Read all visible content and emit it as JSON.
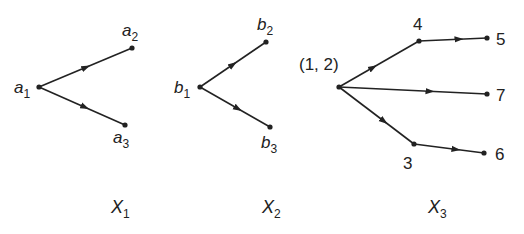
{
  "diagram": {
    "type": "directed-graphs",
    "colors": {
      "stroke": "#222222",
      "background": "#ffffff"
    },
    "graphs": [
      {
        "name": "X",
        "subscript": "1",
        "nodes": [
          {
            "id": "a1",
            "text": "a",
            "sub": "1",
            "x": 39,
            "y": 87
          },
          {
            "id": "a2",
            "text": "a",
            "sub": "2",
            "x": 132,
            "y": 48
          },
          {
            "id": "a3",
            "text": "a",
            "sub": "3",
            "x": 125,
            "y": 125
          }
        ],
        "edges": [
          [
            "a1",
            "a2"
          ],
          [
            "a1",
            "a3"
          ]
        ]
      },
      {
        "name": "X",
        "subscript": "2",
        "nodes": [
          {
            "id": "b1",
            "text": "b",
            "sub": "1",
            "x": 200,
            "y": 87
          },
          {
            "id": "b2",
            "text": "b",
            "sub": "2",
            "x": 266,
            "y": 42
          },
          {
            "id": "b3",
            "text": "b",
            "sub": "3",
            "x": 270,
            "y": 127
          }
        ],
        "edges": [
          [
            "b1",
            "b2"
          ],
          [
            "b1",
            "b3"
          ]
        ]
      },
      {
        "name": "X",
        "subscript": "3",
        "nodes": [
          {
            "id": "12",
            "text": "(1, 2)",
            "x": 339,
            "y": 87
          },
          {
            "id": "4",
            "text": "4",
            "x": 419,
            "y": 41
          },
          {
            "id": "5",
            "text": "5",
            "x": 487,
            "y": 38
          },
          {
            "id": "7",
            "text": "7",
            "x": 487,
            "y": 94
          },
          {
            "id": "3",
            "text": "3",
            "x": 414,
            "y": 144
          },
          {
            "id": "6",
            "text": "6",
            "x": 484,
            "y": 153
          }
        ],
        "edges": [
          [
            "12",
            "4"
          ],
          [
            "4",
            "5"
          ],
          [
            "12",
            "7"
          ],
          [
            "12",
            "3"
          ],
          [
            "3",
            "6"
          ]
        ]
      }
    ],
    "captions": [
      {
        "name": "X",
        "sub": "1"
      },
      {
        "name": "X",
        "sub": "2"
      },
      {
        "name": "X",
        "sub": "3"
      }
    ]
  }
}
